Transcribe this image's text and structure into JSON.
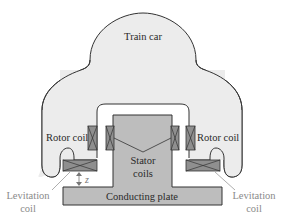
{
  "diagram": {
    "labels": {
      "train_car": "Train car",
      "rotor_coil_left": "Rotor coil",
      "rotor_coil_right": "Rotor coil",
      "stator_coils_line1": "Stator",
      "stator_coils_line2": "coils",
      "conducting_plate": "Conducting plate",
      "levitation_coil_left_line1": "Levitation",
      "levitation_coil_left_line2": "coil",
      "levitation_coil_right_line1": "Levitation",
      "levitation_coil_right_line2": "coil",
      "gap_variable": "z"
    },
    "colors": {
      "car_fill": "#ececec",
      "car_stroke": "#333333",
      "rail_fill": "#bdbdbd",
      "coil_fill": "#8f8f8f",
      "label_gray": "#8a8a8a"
    }
  }
}
